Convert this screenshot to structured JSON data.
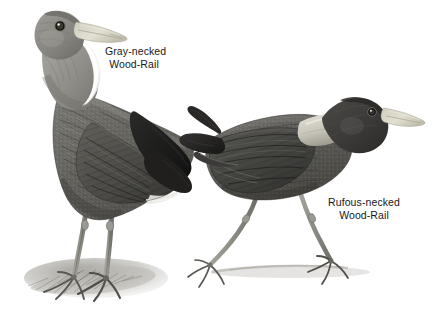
{
  "plate": {
    "background_color": "#ffffff",
    "medium": "grayscale pencil illustration",
    "subject_count": 2
  },
  "labels": {
    "gray_necked": {
      "line1": "Gray-necked",
      "line2": "Wood-Rail",
      "full": "Gray-necked Wood-Rail",
      "color": "#17181a"
    },
    "rufous_necked": {
      "line1": "Rufous-necked",
      "line2": "Wood-Rail",
      "full": "Rufous-necked Wood-Rail",
      "color": "#17181a"
    }
  },
  "birds": [
    {
      "name": "gray-necked-wood-rail",
      "pose": "standing upright, facing right, perched on ground mound",
      "head_color": "#8d8d8a",
      "neck_color": "#9b9a94",
      "throat_color": "#f2f1ee",
      "body_color": "#6c6b67",
      "wing_color": "#575652",
      "tail_color": "#1d1d1d",
      "bill_color": "#d8d6c8",
      "leg_color": "#8b8a85",
      "eye_color": "#1a1a1a"
    },
    {
      "name": "rufous-necked-wood-rail",
      "pose": "striding left-to-right, body horizontal, legs apart",
      "head_color": "#3b3a38",
      "neck_patch_color": "#c9c7bd",
      "body_color": "#5f5e5a",
      "wing_color": "#4a4946",
      "tail_color": "#262524",
      "bill_color": "#ddd9cc",
      "leg_color": "#87867f",
      "eye_color": "#1a1a1a"
    }
  ]
}
